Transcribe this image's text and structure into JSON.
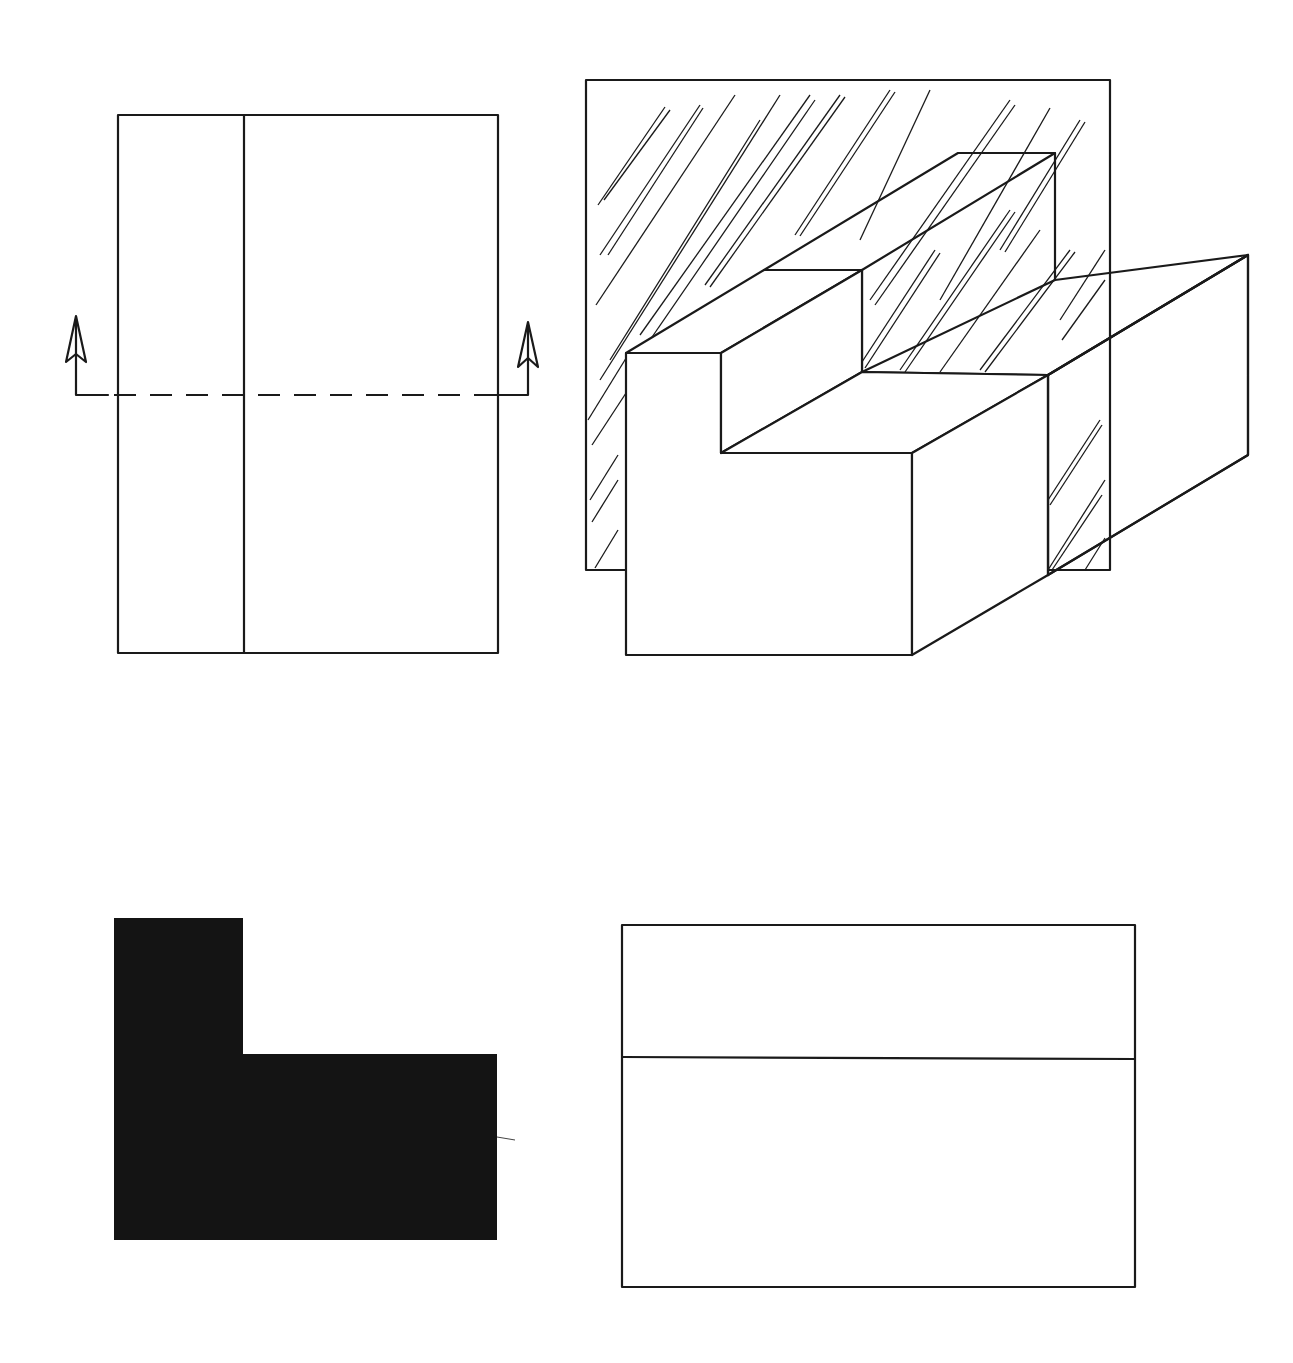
{
  "diagram": {
    "type": "technical-drawing-section-view",
    "views": [
      {
        "id": "top-view",
        "description": "Plan view with vertical dividing line and horizontal dashed cutting-plane line with upward arrows at both ends"
      },
      {
        "id": "isometric-view",
        "description": "Isometric stepped block cut by a hatched section plane"
      },
      {
        "id": "section-view",
        "description": "Filled L-shaped section profile"
      },
      {
        "id": "side-view",
        "description": "Rectangle divided by one horizontal line"
      }
    ],
    "colors": {
      "line": "#1a1a1a",
      "fill": "#141414",
      "background": "#ffffff"
    }
  }
}
